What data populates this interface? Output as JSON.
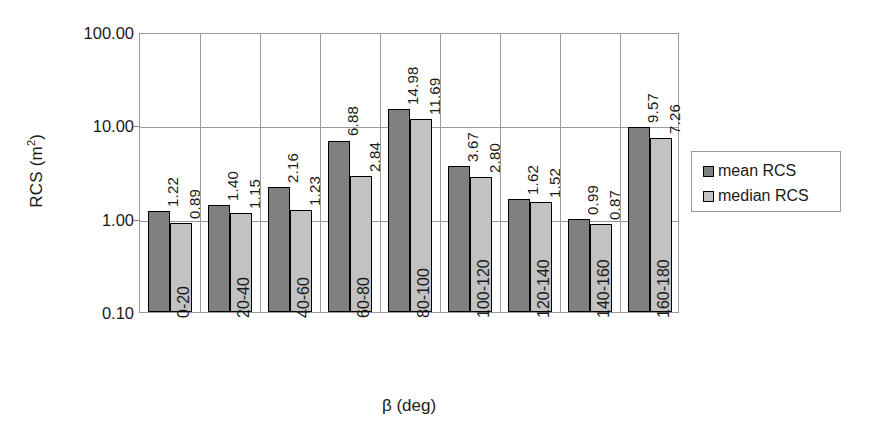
{
  "chart_data": {
    "type": "bar",
    "title": "",
    "subtitle": "",
    "xlabel": "β (deg)",
    "ylabel": "RCS (m²)",
    "ylabel_base": "RCS (m",
    "ylabel_sup": "2",
    "ylabel_close": ")",
    "yscale": "log",
    "ylim": [
      0.1,
      100.0
    ],
    "ytick_labels": [
      "100.00",
      "10.00",
      "1.00",
      "0.10"
    ],
    "ytick_values": [
      100.0,
      10.0,
      1.0,
      0.1
    ],
    "grid": "horizontal gridlines at each decade, vertical gridlines between category groups",
    "legend_position": "right, outside plot, boxed",
    "categories": [
      "0-20",
      "20-40",
      "40-60",
      "60-80",
      "80-100",
      "100-120",
      "120-140",
      "140-160",
      "160-180"
    ],
    "series": [
      {
        "name": "mean RCS",
        "color": "#808080",
        "values": [
          1.22,
          1.4,
          2.16,
          6.88,
          14.98,
          3.67,
          1.62,
          0.99,
          9.57
        ],
        "labels": [
          "1.22",
          "1.40",
          "2.16",
          "6.88",
          "14.98",
          "3.67",
          "1.62",
          "0.99",
          "9.57"
        ]
      },
      {
        "name": "median RCS",
        "color": "#c2c2c2",
        "values": [
          0.89,
          1.15,
          1.23,
          2.84,
          11.69,
          2.8,
          1.52,
          0.87,
          7.26
        ],
        "labels": [
          "0.89",
          "1.15",
          "1.23",
          "2.84",
          "11.69",
          "2.80",
          "1.52",
          "0.87",
          "7.26"
        ]
      }
    ]
  },
  "legend": {
    "items": [
      {
        "label": "mean RCS",
        "color": "#808080"
      },
      {
        "label": "median RCS",
        "color": "#c2c2c2"
      }
    ]
  },
  "colors": {
    "mean_bar": "#808080",
    "median_bar": "#c2c2c2",
    "bar_border": "#000000",
    "grid": "#9a9a9a",
    "text": "#1a1a1a",
    "background": "#ffffff"
  }
}
